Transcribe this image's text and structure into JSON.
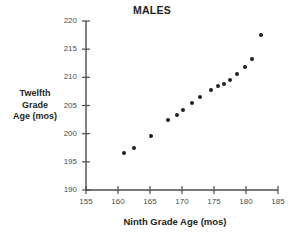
{
  "chart_data": {
    "type": "scatter",
    "title": "MALES",
    "xlabel": "Ninth Grade Age (mos)",
    "ylabel": "Twelfth Grade Age (mos)",
    "ylabel_lines": [
      "Twelfth",
      "Grade",
      "Age (mos)"
    ],
    "xlim": [
      155,
      185
    ],
    "ylim": [
      190,
      220
    ],
    "xticks": [
      155,
      160,
      165,
      170,
      175,
      180,
      185
    ],
    "yticks": [
      190,
      195,
      200,
      205,
      210,
      215,
      220
    ],
    "grid": false,
    "legend": null,
    "marker": "filled-circle",
    "marker_color": "#231f20",
    "points": [
      {
        "x": 161.0,
        "y": 196.5
      },
      {
        "x": 162.5,
        "y": 197.5
      },
      {
        "x": 165.2,
        "y": 199.6
      },
      {
        "x": 167.8,
        "y": 202.4
      },
      {
        "x": 169.2,
        "y": 203.3
      },
      {
        "x": 170.2,
        "y": 204.2
      },
      {
        "x": 171.6,
        "y": 205.4
      },
      {
        "x": 172.8,
        "y": 206.5
      },
      {
        "x": 174.5,
        "y": 207.7
      },
      {
        "x": 175.6,
        "y": 208.4
      },
      {
        "x": 176.6,
        "y": 208.9
      },
      {
        "x": 177.5,
        "y": 209.5
      },
      {
        "x": 178.6,
        "y": 210.6
      },
      {
        "x": 179.8,
        "y": 211.8
      },
      {
        "x": 180.9,
        "y": 213.2
      },
      {
        "x": 182.3,
        "y": 217.6
      }
    ]
  },
  "axis_color": "#4d4d4d",
  "text_color": "#231f20"
}
